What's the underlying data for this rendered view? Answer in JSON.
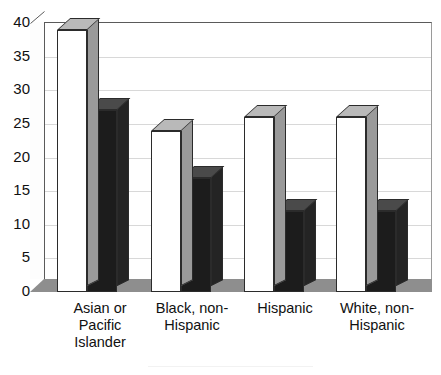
{
  "chart_data": {
    "type": "bar",
    "title": "",
    "xlabel": "",
    "ylabel": "",
    "ylim": [
      0,
      40
    ],
    "yticks": [
      0,
      5,
      10,
      15,
      20,
      25,
      30,
      35,
      40
    ],
    "ytick_labels": [
      "0",
      "5",
      "10",
      "15",
      "20",
      "25",
      "30",
      "35",
      "40"
    ],
    "grid": true,
    "legend_position": "bottom",
    "style": "3d-clustered-column",
    "categories": [
      "Asian or Pacific Islander",
      "Black, non-Hispanic",
      "Hispanic",
      "White, non-Hispanic"
    ],
    "category_lines": [
      [
        "Asian or",
        "Pacific",
        "Islander"
      ],
      [
        "Black, non-",
        "Hispanic"
      ],
      [
        "Hispanic"
      ],
      [
        "White, non-",
        "Hispanic"
      ]
    ],
    "series": [
      {
        "name": "Series 1",
        "color": "#ffffff",
        "values": [
          39,
          24,
          26,
          26
        ]
      },
      {
        "name": "Series 2",
        "color": "#1c1c1c",
        "values": [
          27,
          17,
          12,
          12
        ]
      }
    ]
  },
  "colors": {
    "series_light": "#ffffff",
    "series_dark": "#1c1c1c",
    "grid": "#d8d8d8",
    "axis": "#5a5a5a",
    "floor": "#8e8e8e",
    "text": "#111111"
  }
}
